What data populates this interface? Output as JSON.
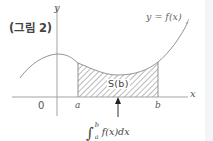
{
  "figure": {
    "title": "(그림 2)",
    "axes": {
      "y_label": "y",
      "x_label": "x",
      "origin_label": "0"
    },
    "points": {
      "a": "a",
      "b": "b"
    },
    "curve_label": "y = f(x)",
    "area_label": "S(b)",
    "integral": {
      "lower": "a",
      "upper": "b",
      "integrand": "f(x)dx"
    },
    "colors": {
      "line": "#8a8a8a",
      "hatch": "#7a7a7a",
      "text": "#555555"
    }
  }
}
